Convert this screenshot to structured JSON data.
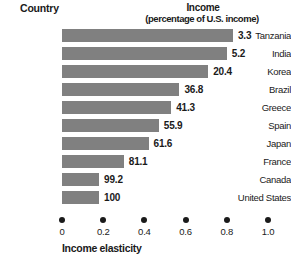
{
  "headers": {
    "country": "Country",
    "income": "Income",
    "income_sub": "(percentage of U.S. income)"
  },
  "axis": {
    "title": "Income elasticity",
    "ticks": [
      "0",
      "0.2",
      "0.4",
      "0.6",
      "0.8",
      "1.0"
    ]
  },
  "chart_data": {
    "type": "bar",
    "orientation": "horizontal",
    "title": "",
    "xlabel": "Income elasticity",
    "ylabel": "Country",
    "xlim": [
      0,
      1.0
    ],
    "xticks": [
      0,
      0.2,
      0.4,
      0.6,
      0.8,
      1.0
    ],
    "grid": false,
    "legend": null,
    "categories": [
      "Tanzania",
      "India",
      "Korea",
      "Brazil",
      "Greece",
      "Spain",
      "Japan",
      "France",
      "Canada",
      "United States"
    ],
    "values": [
      0.83,
      0.8,
      0.71,
      0.57,
      0.53,
      0.47,
      0.42,
      0.3,
      0.18,
      0.18
    ],
    "bar_color": "#808080",
    "data_labels": [
      "3.3",
      "5.2",
      "20.4",
      "36.8",
      "41.3",
      "55.9",
      "61.6",
      "81.1",
      "99.2",
      "100"
    ],
    "data_label_meaning": "Income (percentage of U.S. income)",
    "rows": [
      {
        "country": "Tanzania",
        "elasticity": 0.83,
        "income_pct": "3.3"
      },
      {
        "country": "India",
        "elasticity": 0.8,
        "income_pct": "5.2"
      },
      {
        "country": "Korea",
        "elasticity": 0.71,
        "income_pct": "20.4"
      },
      {
        "country": "Brazil",
        "elasticity": 0.57,
        "income_pct": "36.8"
      },
      {
        "country": "Greece",
        "elasticity": 0.53,
        "income_pct": "41.3"
      },
      {
        "country": "Spain",
        "elasticity": 0.47,
        "income_pct": "55.9"
      },
      {
        "country": "Japan",
        "elasticity": 0.42,
        "income_pct": "61.6"
      },
      {
        "country": "France",
        "elasticity": 0.3,
        "income_pct": "81.1"
      },
      {
        "country": "Canada",
        "elasticity": 0.18,
        "income_pct": "99.2"
      },
      {
        "country": "United States",
        "elasticity": 0.18,
        "income_pct": "100"
      }
    ]
  }
}
